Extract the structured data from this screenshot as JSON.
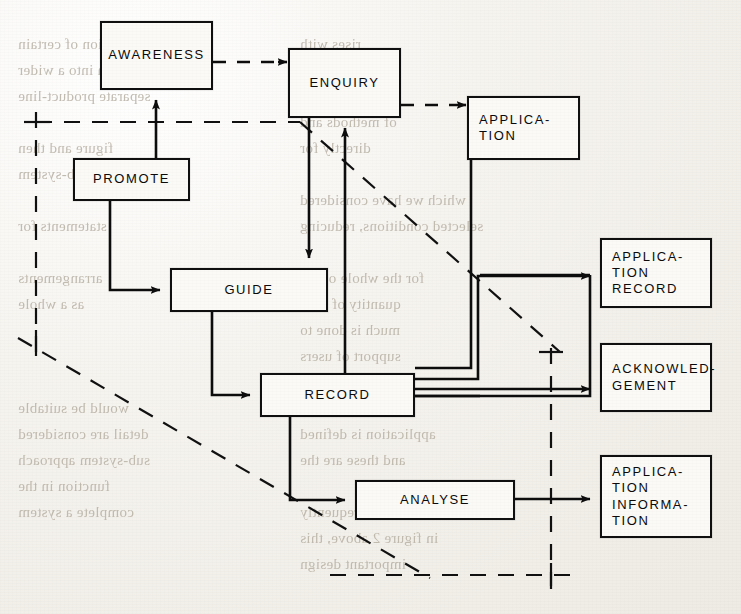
{
  "page": {
    "background_color": "#f2f0eb",
    "ink_color": "#0d0d0d"
  },
  "diagram": {
    "title": "",
    "type": "flow-diagram",
    "nodes": [
      {
        "id": "awareness",
        "label": "AWARENESS",
        "x": 100,
        "y": 21,
        "w": 113,
        "h": 69
      },
      {
        "id": "enquiry",
        "label": "ENQUIRY",
        "x": 288,
        "y": 48,
        "w": 113,
        "h": 70
      },
      {
        "id": "application",
        "label": "APPLICA-\nTION",
        "x": 467,
        "y": 96,
        "w": 113,
        "h": 64
      },
      {
        "id": "promote",
        "label": "PROMOTE",
        "x": 73,
        "y": 158,
        "w": 117,
        "h": 43
      },
      {
        "id": "guide",
        "label": "GUIDE",
        "x": 170,
        "y": 268,
        "w": 158,
        "h": 44
      },
      {
        "id": "app-record",
        "label": "APPLICA-\nTION\nRECORD",
        "x": 600,
        "y": 238,
        "w": 112,
        "h": 70
      },
      {
        "id": "record",
        "label": "RECORD",
        "x": 260,
        "y": 373,
        "w": 155,
        "h": 44
      },
      {
        "id": "acknowledge",
        "label": "ACKNOWLED-\nGEMENT",
        "x": 600,
        "y": 343,
        "w": 112,
        "h": 69
      },
      {
        "id": "analyse",
        "label": "ANALYSE",
        "x": 355,
        "y": 480,
        "w": 160,
        "h": 40
      },
      {
        "id": "app-info",
        "label": "APPLICA-\nTION\nINFORMA-\nTION",
        "x": 600,
        "y": 455,
        "w": 112,
        "h": 83
      }
    ],
    "edges": [
      {
        "from": "awareness",
        "to": "enquiry",
        "style": "dashed"
      },
      {
        "from": "enquiry",
        "to": "application",
        "style": "dashed"
      },
      {
        "from": "promote",
        "to": "awareness",
        "style": "solid"
      },
      {
        "from": "promote",
        "to": "guide",
        "style": "solid"
      },
      {
        "from": "enquiry",
        "to": "guide",
        "style": "solid"
      },
      {
        "from": "enquiry",
        "to": "record",
        "style": "solid"
      },
      {
        "from": "application",
        "to": "record",
        "style": "solid"
      },
      {
        "from": "guide",
        "to": "record",
        "style": "solid"
      },
      {
        "from": "record",
        "to": "app-record",
        "style": "solid"
      },
      {
        "from": "record",
        "to": "acknowledge",
        "style": "solid"
      },
      {
        "from": "record",
        "to": "analyse",
        "style": "solid"
      },
      {
        "from": "analyse",
        "to": "app-info",
        "style": "solid"
      }
    ],
    "boundary": {
      "style": "dash-dot",
      "note": "system boundary drawn with long dashed lines: left vertical, top horizontal, right vertical, bottom horizontal, plus a long diagonal"
    }
  },
  "bleed_through_text": [
    {
      "text": "the function of certain",
      "x": 18,
      "y": 36
    },
    {
      "text": "system into a wider",
      "x": 18,
      "y": 62
    },
    {
      "text": "separate product-line",
      "x": 18,
      "y": 88
    },
    {
      "text": "figure and then",
      "x": 18,
      "y": 140
    },
    {
      "text": "the sub-system",
      "x": 18,
      "y": 166
    },
    {
      "text": "statements for",
      "x": 18,
      "y": 218
    },
    {
      "text": "arrangements",
      "x": 18,
      "y": 270
    },
    {
      "text": "as a whole",
      "x": 18,
      "y": 296
    },
    {
      "text": "would be suitable",
      "x": 18,
      "y": 400
    },
    {
      "text": "detail are considered",
      "x": 18,
      "y": 426
    },
    {
      "text": "sub-system approach",
      "x": 18,
      "y": 452
    },
    {
      "text": "function in the",
      "x": 18,
      "y": 478
    },
    {
      "text": "complete a system",
      "x": 18,
      "y": 504
    },
    {
      "text": "rises with",
      "x": 300,
      "y": 36
    },
    {
      "text": "and this is",
      "x": 300,
      "y": 62
    },
    {
      "text": "the design",
      "x": 300,
      "y": 88
    },
    {
      "text": "of methods and",
      "x": 300,
      "y": 114
    },
    {
      "text": "directly for",
      "x": 300,
      "y": 140
    },
    {
      "text": "which we have considered",
      "x": 300,
      "y": 192
    },
    {
      "text": "selected conditions, reducing",
      "x": 300,
      "y": 218
    },
    {
      "text": "for the whole of the",
      "x": 300,
      "y": 270
    },
    {
      "text": "quantity of time",
      "x": 300,
      "y": 296
    },
    {
      "text": "much is done to",
      "x": 300,
      "y": 322
    },
    {
      "text": "support of users",
      "x": 300,
      "y": 348
    },
    {
      "text": "system concept",
      "x": 300,
      "y": 400
    },
    {
      "text": "application is defined",
      "x": 300,
      "y": 426
    },
    {
      "text": "and these are the",
      "x": 300,
      "y": 452
    },
    {
      "text": "system, frequently",
      "x": 300,
      "y": 504
    },
    {
      "text": "in figure 2 above, this",
      "x": 300,
      "y": 530
    },
    {
      "text": "important design",
      "x": 300,
      "y": 556
    }
  ]
}
